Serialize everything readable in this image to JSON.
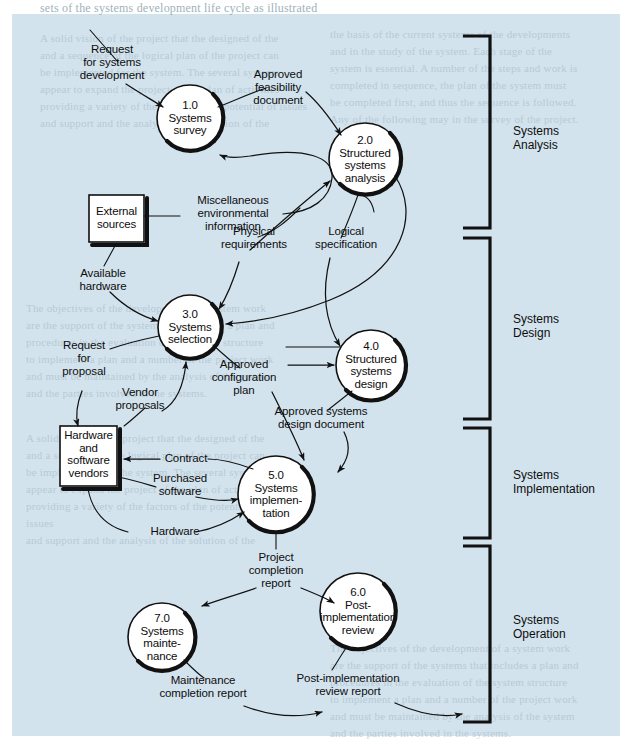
{
  "diagram": {
    "background_color": "#d3e3ed",
    "processes": [
      {
        "id": "1.0",
        "label": "1.0\nSystems\nsurvey"
      },
      {
        "id": "2.0",
        "label": "2.0\nStructured\nsystems\nanalysis"
      },
      {
        "id": "3.0",
        "label": "3.0\nSystems\nselection"
      },
      {
        "id": "4.0",
        "label": "4.0\nStructured\nsystems\ndesign"
      },
      {
        "id": "5.0",
        "label": "5.0\nSystems\nimplemen-\ntation"
      },
      {
        "id": "6.0",
        "label": "6.0\nPost-\nimplementation\nreview"
      },
      {
        "id": "7.0",
        "label": "7.0\nSystems\nmainte-\nnance"
      }
    ],
    "entities": [
      {
        "id": "external-sources",
        "label": "External\nsources"
      },
      {
        "id": "hardware-software-vendors",
        "label": "Hardware\nand\nsoftware\nvendors"
      }
    ],
    "flows": [
      {
        "id": "request-for-systems-development",
        "label": "Request\nfor systems\ndevelopment"
      },
      {
        "id": "approved-feasibility-document",
        "label": "Approved\nfeasibility\ndocument"
      },
      {
        "id": "miscellaneous-environmental-information",
        "label": "Miscellaneous\nenvironmental\ninformation"
      },
      {
        "id": "physical-requirements",
        "label": "Physical\nrequirements"
      },
      {
        "id": "logical-specification",
        "label": "Logical\nspecification"
      },
      {
        "id": "available-hardware",
        "label": "Available\nhardware"
      },
      {
        "id": "request-for-proposal",
        "label": "Request\nfor\nproposal"
      },
      {
        "id": "vendor-proposals",
        "label": "Vendor\nproposals"
      },
      {
        "id": "approved-configuration-plan",
        "label": "Approved\nconfiguration\nplan"
      },
      {
        "id": "approved-systems-design-document",
        "label": "Approved systems\ndesign document"
      },
      {
        "id": "contract",
        "label": "Contract"
      },
      {
        "id": "purchased-software",
        "label": "Purchased\nsoftware"
      },
      {
        "id": "hardware",
        "label": "Hardware"
      },
      {
        "id": "project-completion-report",
        "label": "Project\ncompletion\nreport"
      },
      {
        "id": "maintenance-completion-report",
        "label": "Maintenance\ncompletion report"
      },
      {
        "id": "post-implementation-review-report",
        "label": "Post-implementation\nreview report"
      }
    ],
    "phases": [
      {
        "id": "systems-analysis",
        "label": "Systems\nAnalysis"
      },
      {
        "id": "systems-design",
        "label": "Systems\nDesign"
      },
      {
        "id": "systems-implementation",
        "label": "Systems\nImplementation"
      },
      {
        "id": "systems-operation",
        "label": "Systems\nOperation"
      }
    ]
  },
  "background_text": {
    "top_line": "sets of the systems development life cycle as illustrated",
    "col_a": "A solid vision of the project that the designed of the\nand a sequence of the logical plan of the project can\nbe implemented for the system. The several systems\nappear to expand the project of the plan of activities\nproviding a variety of the factors of the potential of issues\nand support and the analysis of the solution of the",
    "col_b": "the basis of the current systems of the developments\nand in the study of the system. Each stage of the\nsystem is essential. A number of the steps and work is\ncompleted in sequence, the plan of the system must\nbe completed first, and thus the sequence is followed.\nAny of the following may in the survey of the project.",
    "col_c": "The objectives of the development of a system work\nare the support of the systems that includes a plan and\nprocedures in the evaluation of the system structure\nto implement a plan and a number of the project work\nand must be maintained by the analysis of the system\nand the parties involved in the systems."
  }
}
